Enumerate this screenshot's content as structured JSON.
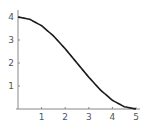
{
  "chart_data": {
    "type": "line",
    "title": "",
    "xlabel": "",
    "ylabel": "",
    "xlim": [
      0,
      5
    ],
    "ylim": [
      0,
      4
    ],
    "grid": false,
    "legend": null,
    "x_ticks": [
      "1",
      "2",
      "3",
      "4",
      "5"
    ],
    "y_ticks": [
      "1",
      "2",
      "3",
      "4"
    ],
    "series": [
      {
        "name": "curve",
        "x": [
          0,
          0.5,
          1,
          1.5,
          2,
          2.5,
          3,
          3.5,
          4,
          4.5,
          5
        ],
        "y": [
          4.0,
          3.9,
          3.62,
          3.18,
          2.62,
          2.0,
          1.38,
          0.82,
          0.38,
          0.1,
          0.0
        ],
        "color": "#1a1a1a"
      }
    ]
  }
}
